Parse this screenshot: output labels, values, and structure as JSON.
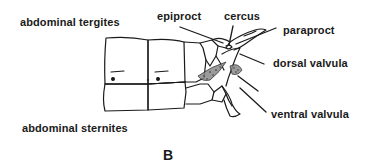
{
  "figure": {
    "panel_letter": "B",
    "colors": {
      "ink": "#1a1a1a",
      "background": "#ffffff",
      "stipple": "#6a6a6a"
    },
    "labels": {
      "abdominal_tergites": "abdominal tergites",
      "abdominal_sternites": "abdominal sternites",
      "epiproct": "epiproct",
      "cercus": "cercus",
      "paraproct": "paraproct",
      "dorsal_valvula": "dorsal valvula",
      "ventral_valvula": "ventral valvula"
    }
  }
}
